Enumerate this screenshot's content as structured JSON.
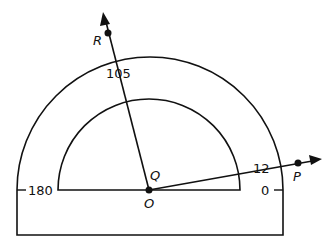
{
  "diagram": {
    "type": "protractor",
    "scale_labels": {
      "left": "180",
      "right": "0",
      "ray_R": "105",
      "ray_P": "12"
    },
    "points": {
      "O": "O",
      "Q": "Q",
      "R": "R",
      "P": "P"
    },
    "colors": {
      "stroke": "#111111",
      "background": "#ffffff"
    }
  }
}
